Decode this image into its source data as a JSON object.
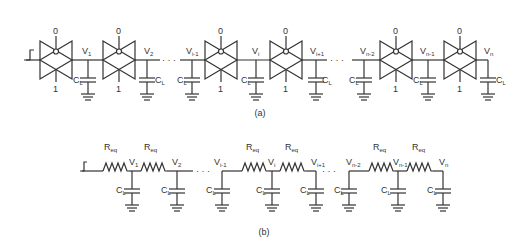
{
  "figure": {
    "panel_a": {
      "caption": "(a)",
      "gate_top_label": "0",
      "gate_bottom_label": "1",
      "nodes": [
        {
          "main": "V",
          "sub": "1"
        },
        {
          "main": "V",
          "sub": "2"
        },
        {
          "main": "V",
          "sub": "i-1"
        },
        {
          "main": "V",
          "sub": "i"
        },
        {
          "main": "V",
          "sub": "i+1"
        },
        {
          "main": "V",
          "sub": "n-2"
        },
        {
          "main": "V",
          "sub": "n-1"
        },
        {
          "main": "V",
          "sub": "n"
        }
      ],
      "capacitor_label": {
        "main": "C",
        "sub": "L"
      },
      "ellipsis": "· · ·"
    },
    "panel_b": {
      "caption": "(b)",
      "resistor_label": {
        "main": "R",
        "sub": "eq"
      },
      "nodes": [
        {
          "main": "V",
          "sub": "1"
        },
        {
          "main": "V",
          "sub": "2"
        },
        {
          "main": "V",
          "sub": "i-1"
        },
        {
          "main": "V",
          "sub": "i"
        },
        {
          "main": "V",
          "sub": "i+1"
        },
        {
          "main": "V",
          "sub": "n-2"
        },
        {
          "main": "V",
          "sub": "n-1"
        },
        {
          "main": "V",
          "sub": "n"
        }
      ],
      "capacitor_label": {
        "main": "C",
        "sub": "L"
      },
      "ellipsis": "· · ·"
    }
  }
}
